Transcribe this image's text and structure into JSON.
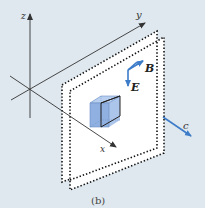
{
  "figure": {
    "caption": "(b)",
    "background": "#dfe8ee",
    "accent_color": "#3d7cc9",
    "axes": {
      "x_label": "x",
      "y_label": "y",
      "z_label": "z"
    },
    "vectors": {
      "magnetic_label": "B",
      "electric_label": "E",
      "propagation_label": "c"
    },
    "elements": [
      "coordinate axes x, y, z",
      "two parallel dotted planes (wavefronts)",
      "shaded blue cube between planes",
      "B field vector",
      "E field vector",
      "propagation direction c"
    ]
  }
}
